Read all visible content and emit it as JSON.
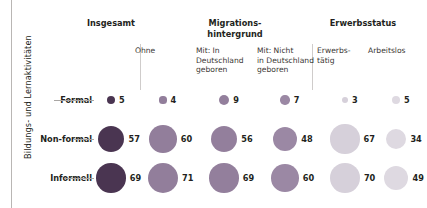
{
  "axis": {
    "y_caption": "Bildungs- und Lernaktivitäten"
  },
  "groups": [
    {
      "label": "Insgesamt",
      "center": 111,
      "top": 18
    },
    {
      "label": "Migrations-\nhintergrund",
      "center": 235,
      "top": 18
    },
    {
      "label": "Erwerbsstatus",
      "center": 363,
      "top": 18
    }
  ],
  "columns": [
    {
      "header": "",
      "center": 111,
      "color": "#4a3551"
    },
    {
      "header": "Ohne",
      "center": 163,
      "color": "#927e9b"
    },
    {
      "header": "Mit: In\nDeutschland\ngeboren",
      "center": 224,
      "color": "#937f9c"
    },
    {
      "header": "Mit: Nicht\nin Deutschland\ngeboren",
      "center": 285,
      "color": "#9b88a4"
    },
    {
      "header": "Erwerbs-\ntätig",
      "center": 345,
      "color": "#d6d0da"
    },
    {
      "header": "Arbeitslos",
      "center": 396,
      "color": "#ded9e1"
    }
  ],
  "rows": [
    {
      "label": "Formal",
      "cy": 100
    },
    {
      "label": "Non-formal",
      "cy": 139
    },
    {
      "label": "Informell",
      "cy": 178
    }
  ],
  "chart_data": {
    "type": "bubble",
    "title": "",
    "xlabel": "",
    "ylabel": "Bildungs- und Lernaktivitäten",
    "grid": false,
    "legend": "none",
    "unit": "percent",
    "categories": [
      "Insgesamt",
      "Ohne",
      "Mit: In Deutschland geboren",
      "Mit: Nicht in Deutschland geboren",
      "Erwerbstätig",
      "Arbeitslos"
    ],
    "series": [
      {
        "name": "Formal",
        "values": [
          5,
          4,
          9,
          7,
          3,
          5
        ]
      },
      {
        "name": "Non-formal",
        "values": [
          57,
          60,
          56,
          48,
          67,
          34
        ]
      },
      {
        "name": "Informell",
        "values": [
          69,
          71,
          69,
          60,
          70,
          49
        ]
      }
    ]
  },
  "dividers": [
    {
      "x": 140,
      "top": 44,
      "height": 46
    },
    {
      "x": 312,
      "top": 44,
      "height": 46
    }
  ],
  "colors": {
    "darkest": "#4a3551",
    "mid": "#927e9b",
    "lightest": "#ded9e1",
    "rule": "#b9b6b4",
    "text": "#231f20"
  }
}
